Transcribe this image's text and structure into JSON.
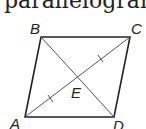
{
  "caption": "parallelogram",
  "diagram": {
    "shape": "parallelogram",
    "points": {
      "A": {
        "label": "A",
        "x": 25,
        "y": 117
      },
      "B": {
        "label": "B",
        "x": 41,
        "y": 37
      },
      "C": {
        "label": "C",
        "x": 130,
        "y": 37
      },
      "D": {
        "label": "D",
        "x": 114,
        "y": 117
      },
      "E": {
        "label": "E",
        "x": 78,
        "y": 78
      }
    },
    "labels": {
      "A": "A",
      "B": "B",
      "C": "C",
      "D": "D",
      "E": "E"
    },
    "segments": [
      "AB",
      "BC",
      "CD",
      "DA",
      "AC",
      "BD"
    ],
    "congruence_marks": [
      "AE",
      "EC"
    ],
    "colors": {
      "stroke": "#222222",
      "diagonal": "#555555"
    }
  }
}
